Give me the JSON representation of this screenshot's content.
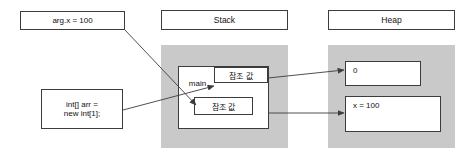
{
  "diagram": {
    "title_stack": "Stack",
    "title_heap": "Heap",
    "notes": [
      {
        "id": "note-arg",
        "text": "arg.x = 100"
      },
      {
        "id": "note-arr",
        "text": "int[] arr =\nnew int[1];"
      }
    ],
    "stack": {
      "header": "Stack",
      "frame_label": "main",
      "slots": [
        {
          "id": "slot-ref-top",
          "text": "참조 값"
        },
        {
          "id": "slot-ref-bottom",
          "text": "참조 값"
        }
      ]
    },
    "heap": {
      "header": "Heap",
      "cells": [
        {
          "id": "heap-cell-array",
          "text": "0"
        },
        {
          "id": "heap-cell-object",
          "text": "x = 100"
        }
      ]
    },
    "colors": {
      "panel_fill": "#c9c9c9",
      "box_fill": "#ffffff",
      "stroke": "#3c3c3c",
      "text": "#111111",
      "page_bg": "#ffffff"
    }
  }
}
